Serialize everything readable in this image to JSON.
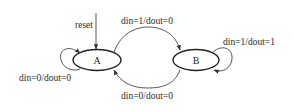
{
  "diagram": {
    "type": "finite-state-machine",
    "states": [
      {
        "id": "A",
        "label": "A",
        "cx": 97,
        "cy": 60,
        "rx": 24,
        "ry": 10.5,
        "initial": true
      },
      {
        "id": "B",
        "label": "B",
        "cx": 196,
        "cy": 60,
        "rx": 23,
        "ry": 10.5
      }
    ],
    "reset": {
      "label": "reset"
    },
    "transitions": [
      {
        "from": "A",
        "to": "A",
        "label": "din=0/dout=0"
      },
      {
        "from": "A",
        "to": "B",
        "label": "din=1/dout=0"
      },
      {
        "from": "B",
        "to": "B",
        "label": "din=1/dout=1"
      },
      {
        "from": "B",
        "to": "A",
        "label": "din=0/dout=0"
      }
    ],
    "colors": {
      "stroke": "#222222",
      "text": "#2a2a2a",
      "background": "#ffffff"
    }
  }
}
